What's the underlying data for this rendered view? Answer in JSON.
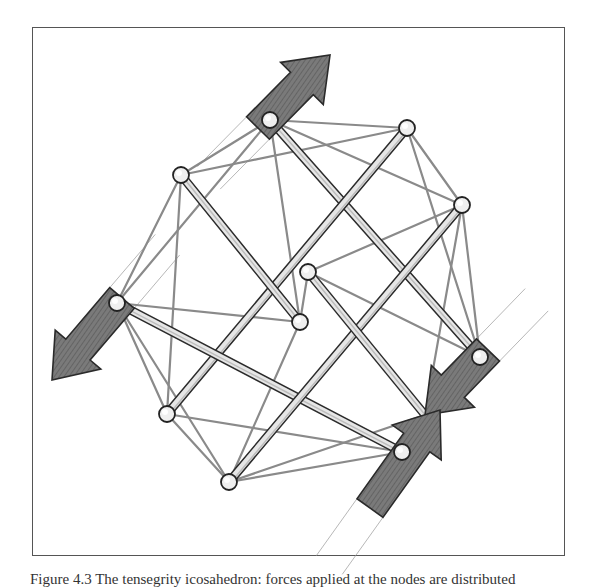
{
  "figure": {
    "caption": "Figure 4.3  The tensegrity icosahedron: forces applied at the nodes are distributed",
    "colors": {
      "frame": "#555555",
      "arrow_fill": "#6e6e6e",
      "arrow_edge": "#2a2a2a",
      "strut_fill": "#e6e6e6",
      "strut_edge": "#2b2b2b",
      "cable": "#8a8a8a",
      "node_fill": "#efefef"
    },
    "nodes": [
      {
        "id": "n1",
        "x": 270,
        "y": 120
      },
      {
        "id": "n2",
        "x": 407,
        "y": 128
      },
      {
        "id": "n3",
        "x": 181,
        "y": 175
      },
      {
        "id": "n4",
        "x": 462,
        "y": 205
      },
      {
        "id": "n5",
        "x": 308,
        "y": 272
      },
      {
        "id": "n6",
        "x": 300,
        "y": 322
      },
      {
        "id": "n7",
        "x": 117,
        "y": 303
      },
      {
        "id": "n8",
        "x": 480,
        "y": 357
      },
      {
        "id": "n9",
        "x": 167,
        "y": 414
      },
      {
        "id": "n10",
        "x": 402,
        "y": 452
      },
      {
        "id": "n11",
        "x": 229,
        "y": 482
      },
      {
        "id": "n12",
        "x": 425,
        "y": 415
      }
    ],
    "struts": [
      [
        "n1",
        "n8"
      ],
      [
        "n2",
        "n9"
      ],
      [
        "n3",
        "n6"
      ],
      [
        "n7",
        "n10"
      ],
      [
        "n4",
        "n11"
      ],
      [
        "n5",
        "n12"
      ]
    ],
    "cables": [
      [
        "n1",
        "n2"
      ],
      [
        "n1",
        "n3"
      ],
      [
        "n1",
        "n4"
      ],
      [
        "n1",
        "n6"
      ],
      [
        "n1",
        "n7"
      ],
      [
        "n2",
        "n3"
      ],
      [
        "n2",
        "n4"
      ],
      [
        "n2",
        "n8"
      ],
      [
        "n3",
        "n7"
      ],
      [
        "n3",
        "n9"
      ],
      [
        "n4",
        "n8"
      ],
      [
        "n4",
        "n5"
      ],
      [
        "n4",
        "n12"
      ],
      [
        "n5",
        "n6"
      ],
      [
        "n5",
        "n8"
      ],
      [
        "n6",
        "n7"
      ],
      [
        "n6",
        "n11"
      ],
      [
        "n7",
        "n9"
      ],
      [
        "n7",
        "n11"
      ],
      [
        "n9",
        "n11"
      ],
      [
        "n9",
        "n10"
      ],
      [
        "n10",
        "n11"
      ],
      [
        "n10",
        "n12"
      ],
      [
        "n8",
        "n12"
      ],
      [
        "n11",
        "n12"
      ]
    ],
    "forces": [
      {
        "name": "force-arrow-top",
        "direction": "up-right",
        "from": [
          258,
          128
        ],
        "to": [
          330,
          55
        ]
      },
      {
        "name": "force-arrow-left",
        "direction": "down-left",
        "from": [
          122,
          298
        ],
        "to": [
          52,
          380
        ]
      },
      {
        "name": "force-arrow-upper-right",
        "direction": "down-left",
        "from": [
          488,
          350
        ],
        "to": [
          425,
          415
        ]
      },
      {
        "name": "force-arrow-lower-left",
        "direction": "up-right",
        "from": [
          370,
          508
        ],
        "to": [
          440,
          410
        ]
      }
    ]
  }
}
